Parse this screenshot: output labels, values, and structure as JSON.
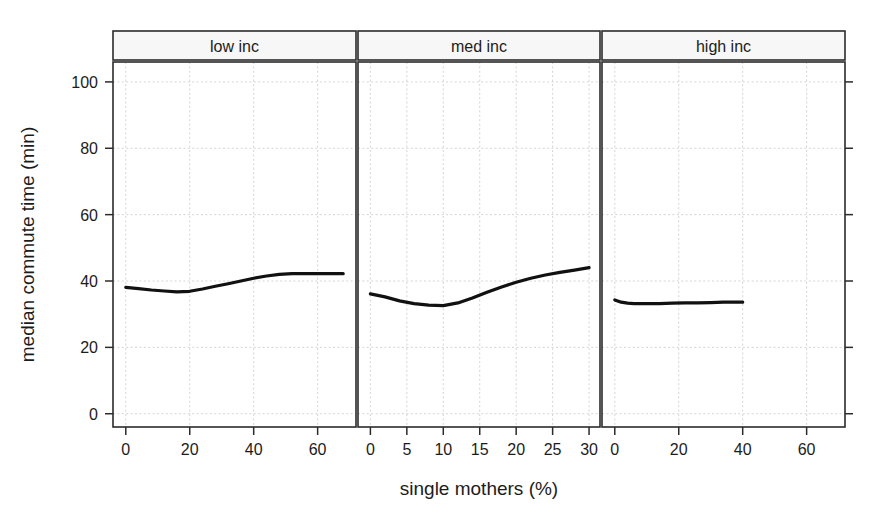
{
  "chart_data": {
    "type": "scatter",
    "title": "",
    "xlabel": "single mothers (%)",
    "ylabel": "median commute time (min)",
    "grid": true,
    "legend": "none",
    "facet_layout": "1x3 horizontal panels",
    "ylim": [
      -4,
      106
    ],
    "yticks": [
      0,
      20,
      40,
      60,
      80,
      100
    ],
    "ytick_labels": [
      "0",
      "20",
      "40",
      "60",
      "80",
      "100"
    ],
    "marker": "small gray diamond",
    "marker_color": "#b4b4b4",
    "trend_color": "#111111",
    "panels": [
      {
        "label": "low inc",
        "xlim": [
          -4,
          72
        ],
        "xticks": [
          0,
          20,
          40,
          60
        ],
        "xtick_labels": [
          "0",
          "20",
          "40",
          "60"
        ],
        "n_points": 1500,
        "scatter_hint": {
          "x_center": 22,
          "x_spread": 13,
          "x_min": 0,
          "x_max": 68,
          "y_center": 39,
          "y_spread": 8.4,
          "y_min": 5,
          "y_max": 100
        },
        "trend": {
          "x": [
            0,
            4,
            8,
            12,
            16,
            20,
            24,
            28,
            32,
            36,
            40,
            44,
            48,
            52,
            56,
            60,
            64,
            68
          ],
          "y": [
            38.1,
            37.7,
            37.3,
            37.0,
            36.7,
            36.9,
            37.6,
            38.4,
            39.2,
            40.0,
            40.8,
            41.5,
            42.0,
            42.2,
            42.2,
            42.2,
            42.2,
            42.2
          ]
        }
      },
      {
        "label": "med inc",
        "xlim": [
          -1.7,
          31.5
        ],
        "xticks": [
          0,
          5,
          10,
          15,
          20,
          25,
          30
        ],
        "xtick_labels": [
          "0",
          "5",
          "10",
          "15",
          "20",
          "25",
          "30"
        ],
        "n_points": 1400,
        "scatter_hint": {
          "x_center": 9,
          "x_spread": 5.5,
          "x_min": 0,
          "x_max": 30,
          "y_center": 36,
          "y_spread": 8.2,
          "y_min": 7,
          "y_max": 66
        },
        "trend": {
          "x": [
            0,
            2,
            4,
            6,
            8,
            10,
            12,
            14,
            16,
            18,
            20,
            22,
            24,
            26,
            28,
            30
          ],
          "y": [
            36.1,
            35.2,
            34.0,
            33.2,
            32.7,
            32.6,
            33.4,
            34.9,
            36.6,
            38.2,
            39.6,
            40.8,
            41.8,
            42.6,
            43.3,
            44.0
          ]
        }
      },
      {
        "label": "high inc",
        "xlim": [
          -4,
          72
        ],
        "xticks": [
          0,
          20,
          40,
          60
        ],
        "xtick_labels": [
          "0",
          "20",
          "40",
          "60"
        ],
        "n_points": 700,
        "scatter_hint": {
          "x_center": 4,
          "x_spread": 3.4,
          "x_min": 0,
          "x_max": 40,
          "y_center": 34,
          "y_spread": 7.2,
          "y_min": 10,
          "y_max": 62
        },
        "trend": {
          "x": [
            0,
            2,
            4,
            6,
            8,
            10,
            14,
            18,
            22,
            26,
            30,
            34,
            38,
            40
          ],
          "y": [
            34.3,
            33.6,
            33.3,
            33.2,
            33.2,
            33.2,
            33.2,
            33.3,
            33.4,
            33.4,
            33.5,
            33.6,
            33.6,
            33.6
          ]
        }
      }
    ]
  },
  "figure": {
    "y_axis_title": "median commute time (min)",
    "x_axis_title": "single mothers (%)",
    "panel_labels": [
      "low inc",
      "med inc",
      "high inc"
    ]
  }
}
